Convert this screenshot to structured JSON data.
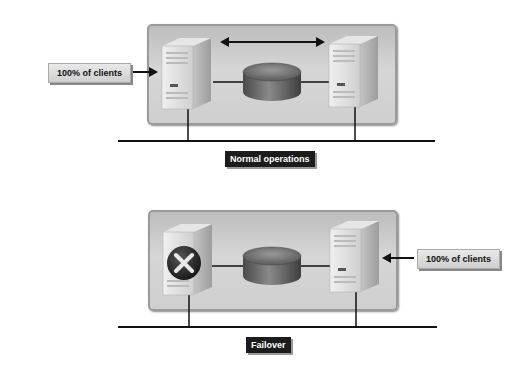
{
  "diagram": {
    "normal": {
      "caption": "Normal operations",
      "client_label": "100% of clients",
      "replication_arrow": "bidirectional",
      "nodes": [
        {
          "name": "server-left",
          "status": "active"
        },
        {
          "name": "shared-storage-disk"
        },
        {
          "name": "server-right",
          "status": "standby"
        }
      ]
    },
    "failover": {
      "caption": "Failover",
      "client_label": "100% of clients",
      "nodes": [
        {
          "name": "server-left",
          "status": "failed",
          "icon": "x-circle-icon"
        },
        {
          "name": "shared-storage-disk"
        },
        {
          "name": "server-right",
          "status": "active"
        }
      ]
    },
    "colors": {
      "panel": "#cfcfcf",
      "caption_bg": "#1c1c1c",
      "caption_text": "#ffffff",
      "disk": "#6a6a6a",
      "line": "#111111"
    }
  }
}
